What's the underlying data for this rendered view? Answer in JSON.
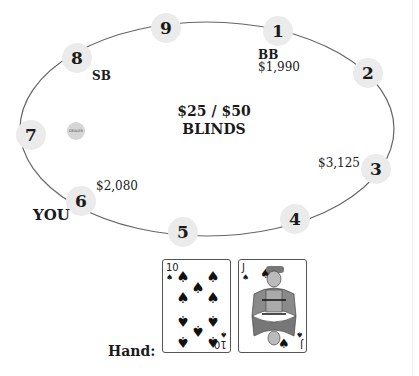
{
  "table": {
    "blinds_amount": "$25 / $50",
    "blinds_label": "BLINDS",
    "dealer_chip_label": "DEALER",
    "seats": [
      {
        "number": "1",
        "role": "BB",
        "stack": "$1,990"
      },
      {
        "number": "2",
        "role": "",
        "stack": ""
      },
      {
        "number": "3",
        "role": "",
        "stack": "$3,125"
      },
      {
        "number": "4",
        "role": "",
        "stack": ""
      },
      {
        "number": "5",
        "role": "",
        "stack": ""
      },
      {
        "number": "6",
        "role": "YOU",
        "stack": "$2,080"
      },
      {
        "number": "7",
        "role": "",
        "stack": ""
      },
      {
        "number": "8",
        "role": "SB",
        "stack": ""
      },
      {
        "number": "9",
        "role": "",
        "stack": ""
      }
    ],
    "dealer_seat": "7"
  },
  "hand": {
    "label": "Hand:",
    "cards": [
      {
        "rank": "10",
        "suit": "♠",
        "name": "Ten of Spades"
      },
      {
        "rank": "J",
        "suit": "♠",
        "name": "Jack of Spades"
      }
    ]
  },
  "colors": {
    "seat_fill": "#ebebeb",
    "table_outline": "#666666",
    "dealer_chip": "#d6d6d6"
  }
}
